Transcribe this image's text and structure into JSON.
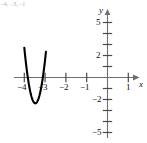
{
  "figure": {
    "top_fragment": "-4, -3, -1",
    "background": "#ffffff",
    "curve_color": "#000000",
    "axis_color": "#6e6e6e"
  },
  "chart_data": {
    "type": "line",
    "title": "",
    "subtitle": "",
    "xlabel": "x",
    "ylabel": "y",
    "xlim": [
      -4.45,
      1.55
    ],
    "ylim": [
      -6.2,
      6.2
    ],
    "grid": false,
    "legend": null,
    "x_ticks": [
      -4,
      -3,
      -2,
      -1,
      1
    ],
    "x_tick_labels": [
      "−4",
      "−3",
      "−2",
      "−1",
      "1"
    ],
    "x_minor_ticks": [
      -4,
      -3,
      -2,
      -1,
      0,
      1
    ],
    "y_ticks": [
      5,
      2,
      -2,
      -5
    ],
    "y_tick_labels": [
      "5",
      "2",
      "−2",
      "−5"
    ],
    "y_minor_ticks": [
      -5,
      -4,
      -3,
      -2,
      -1,
      1,
      2,
      3,
      4,
      5
    ],
    "series": [
      {
        "name": "parabola",
        "type": "line",
        "color": "#000000",
        "linewidth": 2.1,
        "vertex": [
          -3.47,
          -2.35
        ],
        "x_intercepts": [
          -3.83,
          -3.11
        ],
        "equation_form": "y = a(x - h)^2 + k",
        "a": 18,
        "x": [
          -4.0,
          -3.95,
          -3.9,
          -3.85,
          -3.8,
          -3.75,
          -3.7,
          -3.65,
          -3.6,
          -3.55,
          -3.5,
          -3.47,
          -3.44,
          -3.4,
          -3.35,
          -3.3,
          -3.25,
          -3.2,
          -3.15,
          -3.1,
          -3.05,
          -3.0,
          -2.96
        ],
        "y": [
          2.7,
          2.06,
          1.47,
          0.92,
          0.42,
          -0.04,
          -0.45,
          -0.82,
          -1.15,
          -1.43,
          -1.67,
          -2.35,
          -2.33,
          -2.24,
          -2.09,
          -2.0,
          -1.75,
          -1.45,
          -1.1,
          -0.7,
          -0.25,
          0.25,
          0.72
        ]
      }
    ]
  }
}
